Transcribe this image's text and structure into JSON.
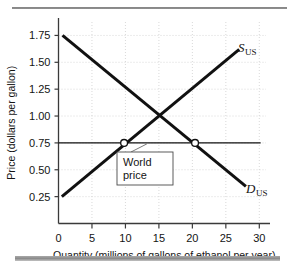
{
  "figure": {
    "name": "us-ethanol-market-supply-demand",
    "top_rule_color": "#8c8c8c",
    "bottom_rule_color": "#9a9a9a"
  },
  "chart_data": {
    "type": "line",
    "title": "",
    "xlabel": "Quantity (millions of gallons of ethanol per year)",
    "ylabel": "Price (dollars per gallon)",
    "xlim": [
      0,
      31
    ],
    "ylim": [
      0,
      1.875
    ],
    "xticks": [
      0,
      5,
      10,
      15,
      20,
      25,
      30
    ],
    "xtick_labels": [
      "0",
      "5",
      "10",
      "15",
      "20",
      "25",
      "30"
    ],
    "yticks": [
      0.25,
      0.5,
      0.75,
      1.0,
      1.25,
      1.5,
      1.75
    ],
    "ytick_labels": [
      "0.25",
      "0.50",
      "0.75",
      "1.00",
      "1.25",
      "1.50",
      "1.75"
    ],
    "grid": true,
    "grid_style": "dotted",
    "grid_color": "#cfcfcf",
    "legend_position": "inline-curve-labels",
    "series": [
      {
        "name": "S_US",
        "label_main": "S",
        "label_sub": "US",
        "role": "supply",
        "color": "#111111",
        "linewidth": 3,
        "x": [
          0.5,
          27.0
        ],
        "y": [
          0.25,
          1.62
        ]
      },
      {
        "name": "D_US",
        "label_main": "D",
        "label_sub": "US",
        "role": "demand",
        "color": "#111111",
        "linewidth": 3,
        "x": [
          0.6,
          28.0
        ],
        "y": [
          1.75,
          0.345
        ]
      },
      {
        "name": "world-price-line",
        "label_main": "",
        "label_sub": "",
        "role": "world-price",
        "color": "#111111",
        "linewidth": 1.2,
        "x": [
          0,
          30.2
        ],
        "y": [
          0.75,
          0.75
        ]
      }
    ],
    "markers": [
      {
        "name": "supply-at-world-price",
        "x": 9.8,
        "y": 0.75,
        "style": "open-circle"
      },
      {
        "name": "demand-at-world-price",
        "x": 20.4,
        "y": 0.75,
        "style": "open-circle"
      }
    ],
    "equilibrium": {
      "name": "domestic-equilibrium",
      "x": 15,
      "y": 1.0,
      "marked": false
    },
    "annotations": [
      {
        "name": "world-price-callout",
        "line1": "World",
        "line2": "price",
        "box": true,
        "points_to_x": 13.2,
        "points_to_y": 0.75
      }
    ]
  }
}
